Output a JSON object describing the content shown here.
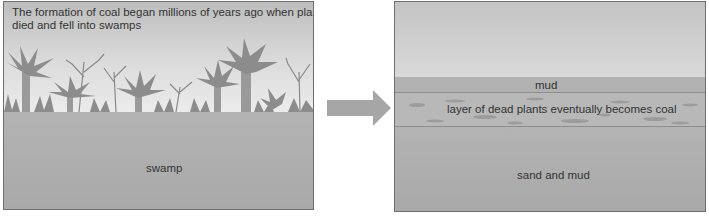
{
  "diagram": {
    "title": "Formation of coal",
    "panels": [
      {
        "id": "swamp-stage",
        "caption": "The formation of coal began millions of years ago when plants died and fell into swamps",
        "caption_line1": "The formation of coal began millions of years ago when plants",
        "caption_line2": "died and fell into swamps",
        "labels": {
          "ground": "swamp"
        }
      },
      {
        "id": "burial-stage",
        "labels": {
          "top_layer": "mud",
          "middle_layer": "layer of dead plants eventually becomes coal",
          "bottom_layer": "sand and mud"
        }
      }
    ],
    "arrow": {
      "direction": "right",
      "color": "#a6a6a6"
    },
    "colors": {
      "sky_dark": "#bdbdbd",
      "sky_light": "#f4f4f4",
      "ground": "#b0b0b0",
      "vegetation": "#8c8c8c",
      "border": "#6e6e6e",
      "text": "#333333"
    }
  }
}
